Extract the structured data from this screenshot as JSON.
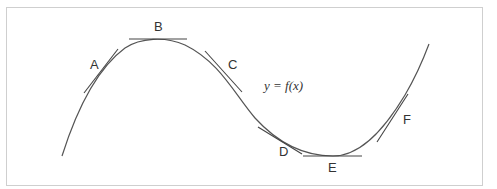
{
  "diagram": {
    "equation": "y = f(x)",
    "curve_color": "#555555",
    "tangent_color": "#444444",
    "points": [
      {
        "label": "A"
      },
      {
        "label": "B"
      },
      {
        "label": "C"
      },
      {
        "label": "D"
      },
      {
        "label": "E"
      },
      {
        "label": "F"
      }
    ]
  }
}
